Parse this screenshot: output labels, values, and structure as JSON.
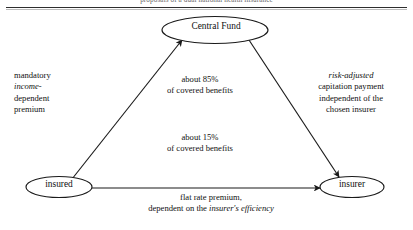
{
  "header": {
    "running_title": "proposals of a dual national health insurance"
  },
  "diagram": {
    "type": "flow-triangle",
    "nodes": [
      {
        "id": "central-fund",
        "label": "Central Fund",
        "shape": "ellipse"
      },
      {
        "id": "insured",
        "label": "insured",
        "shape": "ellipse"
      },
      {
        "id": "insurer",
        "label": "insurer",
        "shape": "ellipse"
      }
    ],
    "edges": [
      {
        "id": "insured-to-central-fund",
        "from": "insured",
        "to": "central-fund",
        "direction": "up-right",
        "arrowhead": "at-target"
      },
      {
        "id": "central-fund-to-insurer",
        "from": "central-fund",
        "to": "insurer",
        "direction": "down-right",
        "arrowhead": "at-target"
      },
      {
        "id": "insured-to-insurer",
        "from": "insured",
        "to": "insurer",
        "direction": "right",
        "arrowhead": "at-target"
      }
    ],
    "labels": {
      "premium_left": {
        "line1": "mandatory",
        "line2_italic": "income-",
        "line3": "dependent",
        "line4": "premium"
      },
      "benefits_85": {
        "line1": "about 85%",
        "line2": "of covered benefits"
      },
      "benefits_15": {
        "line1": "about 15%",
        "line2": "of covered benefits"
      },
      "capitation_right": {
        "line1_italic": "risk-adjusted",
        "line2": "capitation payment",
        "line3": "independent of the",
        "line4": "chosen insurer"
      },
      "flat_rate": {
        "line1": "flat rate premium,",
        "line2_prefix": "dependent on the ",
        "line2_italic": "insurer's efficiency"
      }
    },
    "colors": {
      "stroke": "#1a1a1a",
      "text": "#111111",
      "background": "#ffffff"
    }
  }
}
